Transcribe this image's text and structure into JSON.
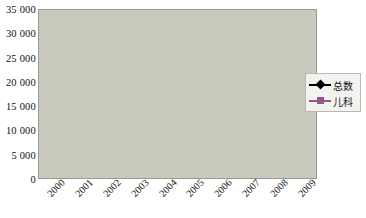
{
  "chart_data": {
    "type": "line",
    "title": "",
    "xlabel": "",
    "ylabel": "",
    "categories": [
      "2000",
      "2001",
      "2002",
      "2003",
      "2004",
      "2005",
      "2006",
      "2007",
      "2008",
      "2009"
    ],
    "series": [
      {
        "name": "总数",
        "color": "#000000",
        "marker": "diamond",
        "values": [
          7400,
          9300,
          9500,
          11200,
          17200,
          13000,
          18000,
          19800,
          24400,
          32600
        ]
      },
      {
        "name": "儿科",
        "color": "#95588a",
        "marker": "square",
        "values": [
          3800,
          4800,
          4800,
          5300,
          5800,
          4100,
          5500,
          7400,
          7200,
          9900
        ]
      }
    ],
    "ylim": [
      0,
      35000
    ],
    "ytick_values": [
      0,
      5000,
      10000,
      15000,
      20000,
      25000,
      30000,
      35000
    ],
    "ytick_labels": [
      "0",
      "5 000",
      "10 000",
      "15 000",
      "20 000",
      "25 000",
      "30 000",
      "35 000"
    ],
    "grid": true,
    "grid_axis": "y",
    "legend_position": "right",
    "plot_background": "#c9c9be",
    "grid_color": "#6e6e66"
  },
  "legend": {
    "entries": [
      {
        "label": "总数"
      },
      {
        "label": "儿科"
      }
    ]
  }
}
